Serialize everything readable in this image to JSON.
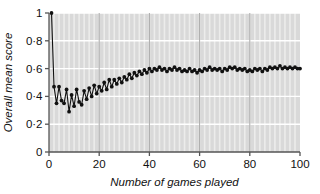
{
  "chart_data": {
    "type": "line",
    "title": "",
    "subtitle": "",
    "xlabel": "Number of games played",
    "ylabel": "Overall mean score",
    "xlim": [
      0,
      100
    ],
    "ylim": [
      0,
      1
    ],
    "xticks": [
      0,
      20,
      40,
      60,
      80,
      100
    ],
    "xtick_labels": [
      "0",
      "20",
      "40",
      "60",
      "80",
      "100"
    ],
    "yticks": [
      0,
      0.2,
      0.4,
      0.6,
      0.8,
      1
    ],
    "ytick_labels": [
      "0",
      "0·2",
      "0·4",
      "0·6",
      "0·8",
      "1"
    ],
    "grid": "major horizontal white lines plus fine vertical minor lines on grey panel",
    "legend": null,
    "legend_position": "none",
    "marker": "filled circle",
    "marker_color": "#111111",
    "line_color": "#111111",
    "panel_color": "#d9d9d9",
    "gridline_color": "#ffffff",
    "axis_color": "#555555",
    "series": [
      {
        "name": "Overall mean score",
        "x": [
          1,
          2,
          3,
          4,
          5,
          6,
          7,
          8,
          9,
          10,
          11,
          12,
          13,
          14,
          15,
          16,
          17,
          18,
          19,
          20,
          21,
          22,
          23,
          24,
          25,
          26,
          27,
          28,
          29,
          30,
          31,
          32,
          33,
          34,
          35,
          36,
          37,
          38,
          39,
          40,
          41,
          42,
          43,
          44,
          45,
          46,
          47,
          48,
          49,
          50,
          51,
          52,
          53,
          54,
          55,
          56,
          57,
          58,
          59,
          60,
          61,
          62,
          63,
          64,
          65,
          66,
          67,
          68,
          69,
          70,
          71,
          72,
          73,
          74,
          75,
          76,
          77,
          78,
          79,
          80,
          81,
          82,
          83,
          84,
          85,
          86,
          87,
          88,
          89,
          90,
          91,
          92,
          93,
          94,
          95,
          96,
          97,
          98,
          99,
          100
        ],
        "y": [
          1.0,
          0.47,
          0.35,
          0.47,
          0.37,
          0.35,
          0.45,
          0.29,
          0.41,
          0.33,
          0.45,
          0.36,
          0.34,
          0.44,
          0.38,
          0.46,
          0.4,
          0.48,
          0.42,
          0.47,
          0.44,
          0.5,
          0.45,
          0.52,
          0.47,
          0.52,
          0.49,
          0.53,
          0.5,
          0.54,
          0.52,
          0.56,
          0.53,
          0.57,
          0.55,
          0.58,
          0.56,
          0.59,
          0.57,
          0.6,
          0.58,
          0.6,
          0.59,
          0.61,
          0.59,
          0.6,
          0.58,
          0.6,
          0.59,
          0.61,
          0.59,
          0.6,
          0.58,
          0.59,
          0.58,
          0.6,
          0.58,
          0.59,
          0.57,
          0.59,
          0.58,
          0.6,
          0.59,
          0.61,
          0.59,
          0.6,
          0.59,
          0.6,
          0.58,
          0.6,
          0.59,
          0.61,
          0.6,
          0.61,
          0.59,
          0.6,
          0.59,
          0.6,
          0.58,
          0.59,
          0.58,
          0.6,
          0.59,
          0.6,
          0.58,
          0.6,
          0.59,
          0.61,
          0.6,
          0.61,
          0.6,
          0.62,
          0.6,
          0.61,
          0.6,
          0.61,
          0.6,
          0.61,
          0.6,
          0.6
        ]
      }
    ]
  }
}
